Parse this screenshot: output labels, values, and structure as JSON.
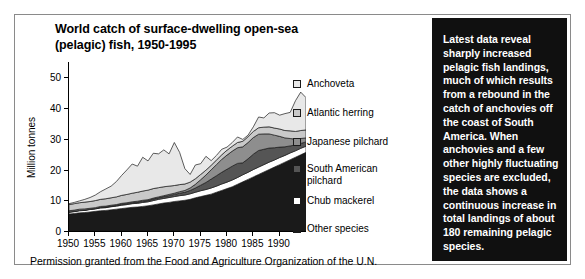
{
  "figure": {
    "title_line1": "World catch of surface-dwelling open-sea",
    "title_line2": "(pelagic) fish, 1950-1995",
    "footer": "Permission granted from the Food and Agriculture Organization of the U.N.",
    "note": "Latest data reveal sharply increased pelagic fish landings, much of which results from a rebound in the catch of anchovies off the coast of South America. When anchovies and a few other highly fluctuating species are excluded, the data shows a continuous increase in total landings of about 180 remaining pelagic species."
  },
  "legend": {
    "items": [
      {
        "label": "Anchoveta",
        "color": "#e8e8e8"
      },
      {
        "label": "Atlantic herring",
        "color": "#c9c9c9"
      },
      {
        "label": "Japanese pilchard",
        "color": "#8e8e8e"
      },
      {
        "label": "South American\npilchard",
        "color": "#555555"
      },
      {
        "label": "Chub mackerel",
        "color": "#ffffff"
      },
      {
        "label": "Other species",
        "color": "#1a1a1a"
      }
    ]
  },
  "chart_data": {
    "type": "area",
    "title": "World catch of surface-dwelling open-sea (pelagic) fish, 1950-1995",
    "xlabel": "",
    "ylabel": "Million tonnes",
    "xlim": [
      1950,
      1995
    ],
    "ylim": [
      0,
      55
    ],
    "yticks": [
      0,
      10,
      20,
      30,
      40,
      50
    ],
    "xticks": [
      1950,
      1955,
      1960,
      1965,
      1970,
      1975,
      1980,
      1985,
      1990
    ],
    "grid": false,
    "stacked": true,
    "legend_position": "right",
    "stack_order_bottom_to_top": [
      "Other species",
      "Chub mackerel",
      "South American pilchard",
      "Japanese pilchard",
      "Atlantic herring",
      "Anchoveta"
    ],
    "x": [
      1950,
      1951,
      1952,
      1953,
      1954,
      1955,
      1956,
      1957,
      1958,
      1959,
      1960,
      1961,
      1962,
      1963,
      1964,
      1965,
      1966,
      1967,
      1968,
      1969,
      1970,
      1971,
      1972,
      1973,
      1974,
      1975,
      1976,
      1977,
      1978,
      1979,
      1980,
      1981,
      1982,
      1983,
      1984,
      1985,
      1986,
      1987,
      1988,
      1989,
      1990,
      1991,
      1992,
      1993,
      1994,
      1995
    ],
    "series": [
      {
        "name": "Other species",
        "color": "#1a1a1a",
        "values": [
          5.5,
          5.7,
          5.9,
          6.0,
          6.2,
          6.4,
          6.6,
          6.7,
          6.9,
          7.1,
          7.3,
          7.5,
          7.7,
          7.8,
          8.0,
          8.2,
          8.5,
          8.8,
          9.1,
          9.3,
          9.6,
          9.8,
          10.0,
          10.3,
          10.8,
          11.2,
          11.6,
          12.0,
          12.6,
          13.2,
          13.8,
          14.4,
          15.2,
          16.0,
          16.8,
          17.6,
          18.4,
          19.2,
          20.0,
          20.8,
          21.6,
          22.4,
          23.2,
          24.0,
          24.8,
          25.6
        ]
      },
      {
        "name": "Chub mackerel",
        "color": "#ffffff",
        "values": [
          0.6,
          0.6,
          0.7,
          0.7,
          0.8,
          0.8,
          0.9,
          0.9,
          1.0,
          1.0,
          1.1,
          1.1,
          1.2,
          1.2,
          1.3,
          1.3,
          1.4,
          1.5,
          1.5,
          1.6,
          1.6,
          1.7,
          1.7,
          1.8,
          1.8,
          1.9,
          1.9,
          2.0,
          2.0,
          2.1,
          2.1,
          2.2,
          2.2,
          2.3,
          2.3,
          2.4,
          2.4,
          2.4,
          2.4,
          2.3,
          2.3,
          2.2,
          2.2,
          2.1,
          2.1,
          2.0
        ]
      },
      {
        "name": "South American pilchard",
        "color": "#555555",
        "values": [
          0.1,
          0.1,
          0.1,
          0.1,
          0.1,
          0.1,
          0.2,
          0.2,
          0.2,
          0.2,
          0.3,
          0.3,
          0.3,
          0.4,
          0.4,
          0.4,
          0.5,
          0.5,
          0.6,
          0.6,
          0.7,
          0.8,
          0.9,
          1.1,
          1.4,
          1.8,
          2.3,
          2.9,
          3.4,
          3.8,
          4.2,
          4.5,
          4.6,
          3.9,
          4.4,
          5.0,
          5.4,
          5.0,
          4.6,
          4.0,
          3.4,
          2.8,
          2.3,
          1.9,
          1.6,
          1.4
        ]
      },
      {
        "name": "Japanese pilchard",
        "color": "#8e8e8e",
        "values": [
          0.4,
          0.4,
          0.4,
          0.4,
          0.3,
          0.3,
          0.3,
          0.3,
          0.3,
          0.3,
          0.3,
          0.3,
          0.3,
          0.3,
          0.3,
          0.3,
          0.3,
          0.3,
          0.3,
          0.4,
          0.4,
          0.5,
          0.6,
          0.8,
          1.2,
          1.8,
          2.4,
          3.0,
          3.6,
          4.2,
          4.6,
          4.9,
          5.1,
          5.2,
          5.3,
          5.4,
          5.3,
          5.0,
          4.6,
          4.1,
          3.5,
          2.9,
          2.4,
          1.9,
          1.6,
          1.3
        ]
      },
      {
        "name": "Atlantic herring",
        "color": "#c9c9c9",
        "values": [
          2.0,
          2.1,
          2.1,
          2.2,
          2.2,
          2.3,
          2.3,
          2.4,
          2.4,
          2.5,
          2.6,
          2.7,
          2.8,
          2.9,
          3.0,
          3.1,
          3.1,
          3.0,
          2.9,
          2.7,
          2.5,
          2.3,
          2.1,
          1.9,
          1.8,
          1.7,
          1.6,
          1.5,
          1.5,
          1.5,
          1.6,
          1.6,
          1.7,
          1.8,
          1.9,
          2.0,
          2.1,
          2.2,
          2.3,
          2.3,
          2.4,
          2.4,
          2.5,
          2.5,
          2.6,
          2.6
        ]
      },
      {
        "name": "Anchoveta",
        "color": "#e8e8e8",
        "values": [
          0.3,
          0.4,
          0.6,
          0.9,
          1.3,
          1.8,
          2.5,
          3.2,
          3.8,
          5.0,
          6.5,
          8.0,
          9.5,
          8.5,
          11.0,
          9.5,
          11.5,
          11.0,
          12.0,
          10.5,
          14.0,
          10.5,
          5.0,
          2.5,
          4.5,
          3.5,
          4.5,
          1.5,
          1.5,
          1.8,
          1.0,
          1.2,
          1.8,
          0.6,
          0.5,
          1.5,
          3.5,
          3.0,
          4.5,
          5.0,
          4.5,
          5.5,
          6.0,
          10.0,
          12.5,
          10.5
        ]
      }
    ]
  }
}
